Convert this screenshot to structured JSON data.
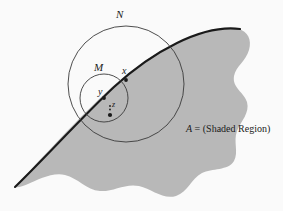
{
  "figure": {
    "background_color": "#fafafa",
    "shaded_region_color": "#b8b8b8",
    "stroke_color": "#3a3a3a",
    "curve_color": "#1a1a1a",
    "labels": {
      "outer_circle": "N",
      "inner_circle": "M",
      "point_x": "x",
      "point_y": "y",
      "point_z": "z"
    },
    "caption": {
      "variable": "A",
      "equals": " = ",
      "description": "(Shaded Region)",
      "full_text": "A = (Shaded Region)"
    },
    "geometry": {
      "outer_circle": {
        "cx": 126,
        "cy": 84,
        "r": 58
      },
      "inner_circle": {
        "cx": 104,
        "cy": 98,
        "r": 24
      },
      "point_x": {
        "cx": 126,
        "cy": 80
      },
      "point_y": {
        "cx": 104,
        "cy": 98
      },
      "point_z": {
        "cx": 110,
        "cy": 115
      }
    }
  }
}
